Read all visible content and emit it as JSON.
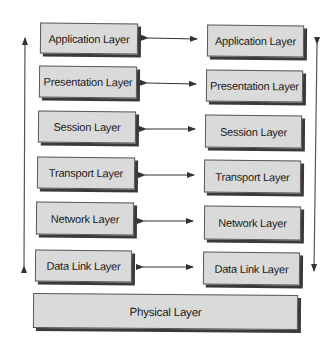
{
  "diagram": {
    "left_stack": [
      {
        "label": "Application Layer"
      },
      {
        "label": "Presentation Layer"
      },
      {
        "label": "Session Layer"
      },
      {
        "label": "Transport Layer"
      },
      {
        "label": "Network Layer"
      },
      {
        "label": "Data Link Layer"
      }
    ],
    "right_stack": [
      {
        "label": "Application Layer"
      },
      {
        "label": "Presentation Layer"
      },
      {
        "label": "Session Layer"
      },
      {
        "label": "Transport Layer"
      },
      {
        "label": "Network Layer"
      },
      {
        "label": "Data Link Layer"
      }
    ],
    "shared": {
      "label": "Physical Layer"
    },
    "connectors": {
      "peer_arrows": "bidirectional horizontal between matching layers",
      "left_vertical": "bidirectional vertical arrow beside left stack",
      "right_vertical": "bidirectional vertical arrow beside right stack"
    },
    "colors": {
      "box_fill": "#dadada",
      "box_border": "#5a5a5a",
      "shadow": "#3a3a3a",
      "arrow": "#333333"
    }
  }
}
